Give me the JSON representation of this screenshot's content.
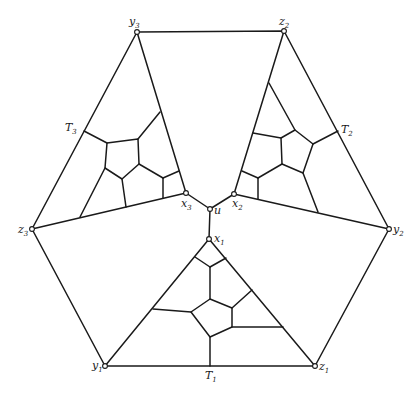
{
  "diagram": {
    "type": "graph",
    "labels": {
      "u": {
        "text": "u",
        "sub": ""
      },
      "x1": {
        "text": "x",
        "sub": "1"
      },
      "x2": {
        "text": "x",
        "sub": "2"
      },
      "x3": {
        "text": "x",
        "sub": "3"
      },
      "y1": {
        "text": "y",
        "sub": "1"
      },
      "y2": {
        "text": "y",
        "sub": "2"
      },
      "y3": {
        "text": "y",
        "sub": "3"
      },
      "z1": {
        "text": "z",
        "sub": "1"
      },
      "z2": {
        "text": "z",
        "sub": "2"
      },
      "z3": {
        "text": "z",
        "sub": "3"
      },
      "T1": {
        "text": "T",
        "sub": "1"
      },
      "T2": {
        "text": "T",
        "sub": "2"
      },
      "T3": {
        "text": "T",
        "sub": "3"
      }
    },
    "nodes": [
      "u",
      "x1",
      "x2",
      "x3",
      "y1",
      "y2",
      "y3",
      "z1",
      "z2",
      "z3"
    ],
    "outer_cycle": [
      "y3",
      "z2",
      "y2",
      "z1",
      "y1",
      "z3"
    ],
    "edge_color": "#1a1a1a"
  }
}
